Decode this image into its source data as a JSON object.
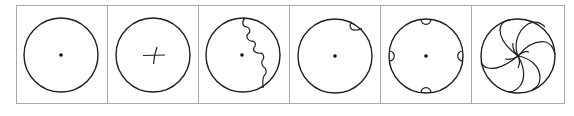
{
  "figure": {
    "frame_color": "#a8a8a8",
    "stroke_color": "#1e1e1e",
    "panels": [
      {
        "index": 1,
        "name": "circle-with-center-dot",
        "feature": "center dot"
      },
      {
        "index": 2,
        "name": "circle-with-cross",
        "feature": "small cross at center"
      },
      {
        "index": 3,
        "name": "circle-with-scalloped-line",
        "feature": "center dot and a scalloped line from top to lower-right edge"
      },
      {
        "index": 4,
        "name": "circle-with-one-notch",
        "feature": "center dot and one small inward notch at upper right"
      },
      {
        "index": 5,
        "name": "circle-with-four-notches",
        "feature": "center dot and four small inward notches at top, bottom, left and right"
      },
      {
        "index": 6,
        "name": "circle-with-spiral-arcs",
        "feature": "curved arcs spiralling out from the center to the circumference"
      }
    ]
  }
}
